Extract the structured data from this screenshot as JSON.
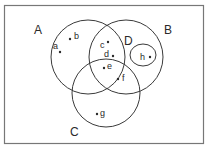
{
  "diagram": {
    "type": "venn",
    "colors": {
      "stroke": "#3a3a3a",
      "border": "#777777",
      "text": "#2a2a2a",
      "background": "#ffffff"
    },
    "universe": {
      "x": 4,
      "y": 5,
      "width": 199,
      "height": 138
    },
    "sets": [
      {
        "id": "A",
        "label": "A",
        "shape": "circle",
        "cx": 88,
        "cy": 57,
        "r": 37,
        "label_x": 34,
        "label_y": 34
      },
      {
        "id": "B",
        "label": "B",
        "shape": "circle",
        "cx": 126,
        "cy": 57,
        "r": 37,
        "label_x": 164,
        "label_y": 34
      },
      {
        "id": "C",
        "label": "C",
        "shape": "circle",
        "cx": 106,
        "cy": 93,
        "r": 34,
        "label_x": 70,
        "label_y": 136
      },
      {
        "id": "D",
        "label": "D",
        "shape": "ellipse-subset",
        "note": "D is region of B labeled inside",
        "label_x": 124,
        "label_y": 45
      }
    ],
    "inner_set": {
      "id": "H",
      "shape": "ellipse",
      "cx": 143,
      "cy": 55,
      "rx": 13,
      "ry": 11
    },
    "elements": [
      {
        "name": "a",
        "dot_x": 60,
        "dot_y": 52,
        "label_x": 53,
        "label_y": 49
      },
      {
        "name": "b",
        "dot_x": 70,
        "dot_y": 39,
        "label_x": 74,
        "label_y": 39
      },
      {
        "name": "c",
        "dot_x": 108,
        "dot_y": 42,
        "label_x": 100,
        "label_y": 48
      },
      {
        "name": "d",
        "dot_x": 113,
        "dot_y": 56,
        "label_x": 104,
        "label_y": 57
      },
      {
        "name": "e",
        "dot_x": 104,
        "dot_y": 68,
        "label_x": 107,
        "label_y": 69
      },
      {
        "name": "f",
        "dot_x": 118,
        "dot_y": 79,
        "label_x": 122,
        "label_y": 81
      },
      {
        "name": "g",
        "dot_x": 97,
        "dot_y": 114,
        "label_x": 100,
        "label_y": 116
      },
      {
        "name": "h",
        "dot_x": 150,
        "dot_y": 57,
        "label_x": 140,
        "label_y": 60
      }
    ]
  }
}
